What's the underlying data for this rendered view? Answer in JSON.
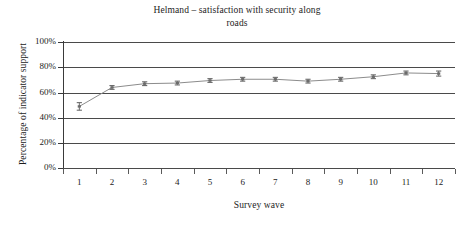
{
  "chart_data": {
    "type": "line",
    "title": "Helmand – satisfaction with security along roads",
    "title_line1": "Helmand – satisfaction with security along",
    "title_line2": "roads",
    "xlabel": "Survey wave",
    "ylabel": "Percentage of indicator support",
    "categories": [
      "1",
      "2",
      "3",
      "4",
      "5",
      "6",
      "7",
      "8",
      "9",
      "10",
      "11",
      "12"
    ],
    "values": [
      49,
      64,
      67,
      67.5,
      69.5,
      70.5,
      70.5,
      69,
      70.5,
      72.5,
      75.5,
      75
    ],
    "error_low": [
      46,
      62.5,
      65.5,
      66,
      68,
      69,
      69,
      67.5,
      69,
      71,
      74,
      73
    ],
    "error_high": [
      52,
      65.5,
      68.5,
      69,
      71,
      72,
      72,
      70.5,
      72,
      74,
      77,
      77
    ],
    "ylim": [
      0,
      100
    ],
    "ytick_labels": [
      "0%",
      "20%",
      "40%",
      "60%",
      "80%",
      "100%"
    ],
    "ytick_values": [
      0,
      20,
      40,
      60,
      80,
      100
    ],
    "grid": true,
    "grid_axis": "y",
    "legend": false,
    "legend_position": "none",
    "series": [
      {
        "name": "Percentage of indicator support",
        "values": [
          49,
          64,
          67,
          67.5,
          69.5,
          70.5,
          70.5,
          69,
          70.5,
          72.5,
          75.5,
          75
        ]
      }
    ],
    "line_color": "#8c8c8c",
    "marker_color": "#6b6b6b",
    "grid_color": "#4a4a4a",
    "axis_color": "#3a3a3a",
    "background_color": "#ffffff"
  }
}
